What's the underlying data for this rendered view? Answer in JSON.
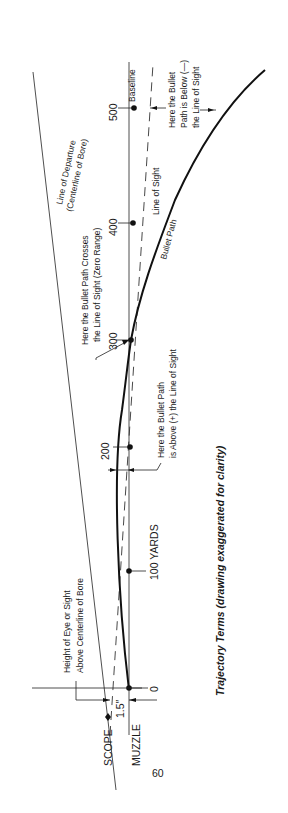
{
  "diagram": {
    "title": "Trajectory Terms (drawing exaggerated for clarity)",
    "orientation": "rotated 90 degrees counter-clockwise",
    "page_number": "60",
    "lines": {
      "line_of_departure": "Line of Departure",
      "line_of_departure_sub": "(Centerline of Bore)",
      "baseline": "Baseline",
      "line_of_sight": "Line of Sight",
      "bullet_path": "Bullet Path"
    },
    "range_marks": [
      {
        "label": "0",
        "yards": 0
      },
      {
        "label": "100 YARDS",
        "yards": 100
      },
      {
        "label": "200",
        "yards": 200
      },
      {
        "label": "300",
        "yards": 300
      },
      {
        "label": "400",
        "yards": 400
      },
      {
        "label": "500",
        "yards": 500
      }
    ],
    "annotations": {
      "zero_range_line1": "Here the Bullet Path Crosses",
      "zero_range_line2": "the Line of Sight (Zero Range)",
      "above_line1": "Here the Bullet Path",
      "above_line2": "is Above (+)  the  Line  of  Sight",
      "below_line1": "Here the Bullet",
      "below_line2": "Path is Below (—)",
      "below_line3": "the Line of Sight",
      "height_line1": "Height of Eye or Sight",
      "height_line2": "Above Centerline of Bore",
      "height_value": "1.5″",
      "scope": "SCOPE",
      "muzzle": "MUZZLE"
    }
  }
}
